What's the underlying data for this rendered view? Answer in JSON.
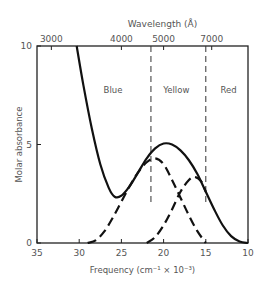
{
  "chart_data": {
    "type": "line",
    "title": "",
    "top_axis_label": "Wavelength (Å)",
    "top_ticks": [
      {
        "label": "3000",
        "freq": 33.3
      },
      {
        "label": "4000",
        "freq": 25.0
      },
      {
        "label": "5000",
        "freq": 20.0
      },
      {
        "label": "7000",
        "freq": 14.3
      }
    ],
    "xlabel": "Frequency (cm⁻¹ × 10⁻³)",
    "ylabel": "Molar absorbance",
    "xlim": [
      35,
      10
    ],
    "ylim": [
      0,
      10
    ],
    "x_ticks": [
      35,
      30,
      25,
      20,
      15,
      10
    ],
    "y_ticks": [
      0,
      5,
      10
    ],
    "grid": false,
    "region_labels": [
      {
        "label": "Blue",
        "x": 26.0,
        "y": 7.6
      },
      {
        "label": "Yellow",
        "x": 18.5,
        "y": 7.6
      },
      {
        "label": "Red",
        "x": 12.3,
        "y": 7.6
      }
    ],
    "region_boundaries": [
      21.5,
      15.0
    ],
    "series": [
      {
        "name": "Total absorption",
        "style": "solid",
        "points": [
          [
            30.3,
            10.0
          ],
          [
            29.5,
            8.0
          ],
          [
            28.5,
            5.8
          ],
          [
            27.5,
            4.0
          ],
          [
            26.5,
            2.8
          ],
          [
            25.8,
            2.35
          ],
          [
            25.0,
            2.4
          ],
          [
            24.0,
            2.9
          ],
          [
            23.0,
            3.6
          ],
          [
            22.0,
            4.3
          ],
          [
            21.0,
            4.8
          ],
          [
            20.0,
            5.05
          ],
          [
            19.0,
            5.0
          ],
          [
            18.0,
            4.7
          ],
          [
            17.0,
            4.2
          ],
          [
            16.0,
            3.5
          ],
          [
            15.0,
            2.6
          ],
          [
            14.0,
            1.7
          ],
          [
            13.0,
            0.9
          ],
          [
            12.0,
            0.35
          ],
          [
            11.0,
            0.08
          ],
          [
            10.0,
            0.0
          ]
        ]
      },
      {
        "name": "Blue-absorbing component",
        "style": "dashed",
        "points": [
          [
            29.0,
            0.0
          ],
          [
            28.0,
            0.15
          ],
          [
            27.0,
            0.6
          ],
          [
            26.0,
            1.3
          ],
          [
            25.0,
            2.1
          ],
          [
            24.0,
            2.9
          ],
          [
            23.0,
            3.6
          ],
          [
            22.0,
            4.1
          ],
          [
            21.0,
            4.3
          ],
          [
            20.0,
            4.0
          ],
          [
            19.0,
            3.2
          ],
          [
            18.0,
            2.3
          ],
          [
            17.0,
            1.4
          ],
          [
            16.0,
            0.6
          ],
          [
            15.0,
            0.0
          ]
        ]
      },
      {
        "name": "Yellow-absorbing component",
        "style": "dashed",
        "points": [
          [
            22.0,
            0.0
          ],
          [
            21.0,
            0.3
          ],
          [
            20.0,
            0.9
          ],
          [
            19.0,
            1.7
          ],
          [
            18.0,
            2.6
          ],
          [
            17.0,
            3.2
          ],
          [
            16.3,
            3.35
          ],
          [
            15.5,
            3.1
          ],
          [
            15.0,
            2.6
          ]
        ]
      }
    ]
  }
}
